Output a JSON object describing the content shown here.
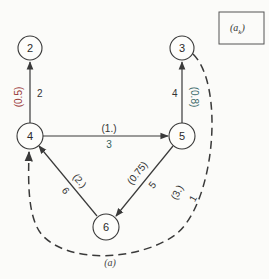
{
  "legend": {
    "label": "(a",
    "subscript": "k",
    "close": ")"
  },
  "caption": "(a)",
  "colors": {
    "node_stroke": "#3a3a3a",
    "edge": "#3a3a3a",
    "prob_label_2": "#9a3a3a",
    "prob_label_3": "#3a6a6a",
    "text": "#333333",
    "background": "#fbfbf9"
  },
  "nodes": [
    {
      "id": "2",
      "label": "2"
    },
    {
      "id": "3",
      "label": "3"
    },
    {
      "id": "4",
      "label": "4"
    },
    {
      "id": "5",
      "label": "5"
    },
    {
      "id": "6",
      "label": "6"
    }
  ],
  "edges": [
    {
      "from": "4",
      "to": "2",
      "style": "solid",
      "weight": "2",
      "prob": "(0.5)"
    },
    {
      "from": "5",
      "to": "3",
      "style": "solid",
      "weight": "4",
      "prob": "(0.8)"
    },
    {
      "from": "4",
      "to": "5",
      "style": "solid",
      "weight": "3",
      "prob": "(1.)"
    },
    {
      "from": "5",
      "to": "6",
      "style": "solid",
      "weight": "5",
      "prob": "(0.75)"
    },
    {
      "from": "6",
      "to": "4",
      "style": "solid",
      "weight": "6",
      "prob": "(2.)"
    },
    {
      "from": "3",
      "to": "4",
      "style": "dashed",
      "weight": "1",
      "prob": "(3.)"
    }
  ]
}
